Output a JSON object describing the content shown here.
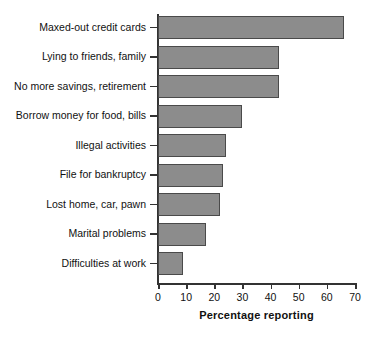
{
  "chart_data": {
    "type": "bar",
    "orientation": "horizontal",
    "title": "",
    "xlabel": "Percentage reporting",
    "ylabel": "",
    "xlim": [
      0,
      70
    ],
    "xticks": [
      0,
      10,
      20,
      30,
      40,
      50,
      60,
      70
    ],
    "grid": false,
    "legend": null,
    "bar_color": "#8c8c8c",
    "bar_edge_color": "#4a4a4a",
    "categories": [
      "Maxed-out credit cards",
      "Lying to friends, family",
      "No more savings, retirement",
      "Borrow money for food, bills",
      "Illegal activities",
      "File for bankruptcy",
      "Lost home, car, pawn",
      "Marital problems",
      "Difficulties at work"
    ],
    "values": [
      66,
      43,
      43,
      30,
      24,
      23,
      22,
      17,
      9
    ]
  }
}
